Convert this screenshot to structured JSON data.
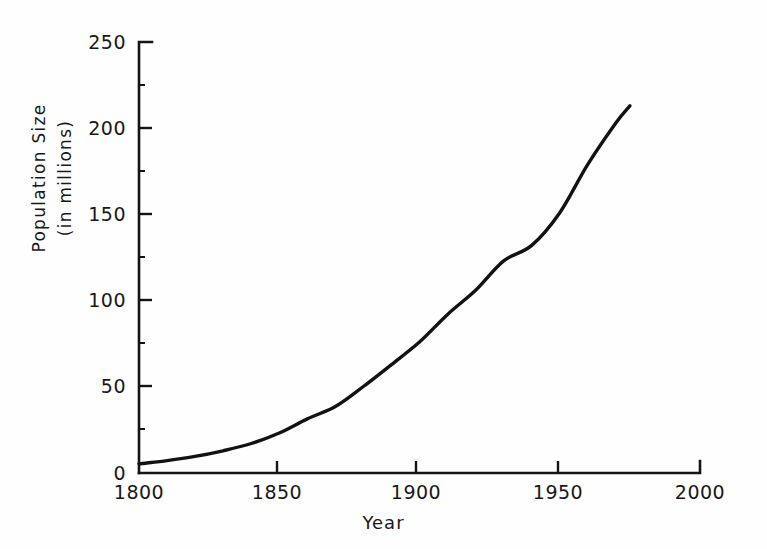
{
  "chart_data": {
    "type": "line",
    "title": "",
    "subtitle": "",
    "xlabel": "Year",
    "ylabel": "Population Size\n(in millions)",
    "ylabel_line1": "Population  Size",
    "ylabel_line2": "(in millions)",
    "xlim": [
      1800,
      2000
    ],
    "ylim": [
      0,
      250
    ],
    "xticks": [
      1800,
      1850,
      1900,
      1950,
      2000
    ],
    "xtick_labels": [
      "1800",
      "1850",
      "1900",
      "1950",
      "2000"
    ],
    "yticks": [
      0,
      50,
      100,
      150,
      200,
      250
    ],
    "ytick_labels": [
      "0",
      "50",
      "100",
      "150",
      "200",
      "250"
    ],
    "grid": false,
    "legend": null,
    "line_color": "#121212",
    "line_width": 3.4,
    "series": [
      {
        "name": "United States population",
        "x": [
          1800,
          1810,
          1820,
          1830,
          1840,
          1850,
          1860,
          1870,
          1880,
          1890,
          1900,
          1910,
          1920,
          1930,
          1940,
          1950,
          1960,
          1970,
          1975
        ],
        "values": [
          5.3,
          7.2,
          9.6,
          12.9,
          17.1,
          23.2,
          31.4,
          38.6,
          50.2,
          62.9,
          76.0,
          92.0,
          106.0,
          123.0,
          132.0,
          151.0,
          179.0,
          203.0,
          213.0
        ]
      }
    ],
    "annotations": []
  },
  "axes": {
    "x_title": "Year",
    "y_title_line1": "Population  Size",
    "y_title_line2": "(in millions)"
  }
}
